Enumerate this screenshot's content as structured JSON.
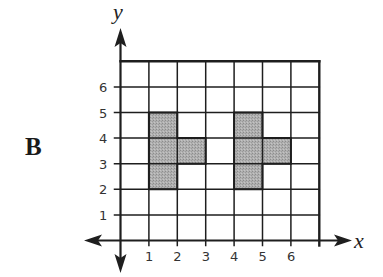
{
  "figure": {
    "label": "B",
    "x_axis_label": "x",
    "y_axis_label": "y",
    "x_ticks": [
      "1",
      "2",
      "3",
      "4",
      "5",
      "6"
    ],
    "y_ticks": [
      "1",
      "2",
      "3",
      "4",
      "5",
      "6"
    ],
    "grid": {
      "x_min": 0,
      "x_max": 7,
      "y_min": 0,
      "y_max": 7
    },
    "colors": {
      "line": "#1e1e1e",
      "fill": "#a9a9a9",
      "background": "#ffffff"
    },
    "shapes": [
      {
        "name": "shape-left",
        "vertices": [
          [
            1,
            2
          ],
          [
            2,
            2
          ],
          [
            2,
            3
          ],
          [
            3,
            3
          ],
          [
            3,
            4
          ],
          [
            2,
            4
          ],
          [
            2,
            5
          ],
          [
            1,
            5
          ]
        ]
      },
      {
        "name": "shape-right",
        "vertices": [
          [
            4,
            2
          ],
          [
            5,
            2
          ],
          [
            5,
            3
          ],
          [
            6,
            3
          ],
          [
            6,
            4
          ],
          [
            5,
            4
          ],
          [
            5,
            5
          ],
          [
            4,
            5
          ]
        ]
      }
    ]
  }
}
